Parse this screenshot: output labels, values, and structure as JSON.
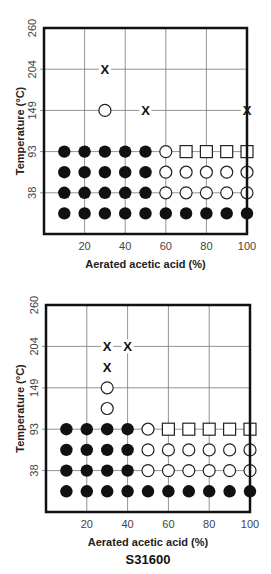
{
  "chart_data": [
    {
      "type": "scatter",
      "title": "S30400",
      "xlabel": "Aerated acetic acid (%)",
      "ylabel": "Temperature (°C)",
      "x_ticks": [
        20,
        40,
        60,
        80,
        100
      ],
      "y_ticks": [
        38,
        93,
        149,
        204,
        260
      ],
      "xlim": [
        0,
        100
      ],
      "grid": true,
      "legend": "none",
      "markers": {
        "filled_circle": "row of filled black circles",
        "open_circle": "open circle",
        "open_square": "open square",
        "x": "cross mark"
      },
      "rows": [
        {
          "y": "204",
          "points": [
            {
              "x": 30,
              "marker": "x"
            }
          ]
        },
        {
          "y": "149",
          "points": [
            {
              "x": 30,
              "marker": "open_circle"
            },
            {
              "x": 50,
              "marker": "x"
            },
            {
              "x": 100,
              "marker": "x"
            }
          ]
        },
        {
          "y": "93",
          "points": [
            {
              "x": 10,
              "marker": "filled_circle"
            },
            {
              "x": 20,
              "marker": "filled_circle"
            },
            {
              "x": 30,
              "marker": "filled_circle"
            },
            {
              "x": 40,
              "marker": "filled_circle"
            },
            {
              "x": 50,
              "marker": "filled_circle"
            },
            {
              "x": 60,
              "marker": "open_circle"
            },
            {
              "x": 70,
              "marker": "open_square"
            },
            {
              "x": 80,
              "marker": "open_square"
            },
            {
              "x": 90,
              "marker": "open_square"
            },
            {
              "x": 100,
              "marker": "open_square"
            }
          ]
        },
        {
          "y": "between 38 and 93",
          "points": [
            {
              "x": 10,
              "marker": "filled_circle"
            },
            {
              "x": 20,
              "marker": "filled_circle"
            },
            {
              "x": 30,
              "marker": "filled_circle"
            },
            {
              "x": 40,
              "marker": "filled_circle"
            },
            {
              "x": 50,
              "marker": "filled_circle"
            },
            {
              "x": 60,
              "marker": "open_circle"
            },
            {
              "x": 70,
              "marker": "open_circle"
            },
            {
              "x": 80,
              "marker": "open_circle"
            },
            {
              "x": 90,
              "marker": "open_circle"
            },
            {
              "x": 100,
              "marker": "open_circle"
            }
          ]
        },
        {
          "y": "38",
          "points": [
            {
              "x": 10,
              "marker": "filled_circle"
            },
            {
              "x": 20,
              "marker": "filled_circle"
            },
            {
              "x": 30,
              "marker": "filled_circle"
            },
            {
              "x": 40,
              "marker": "filled_circle"
            },
            {
              "x": 50,
              "marker": "filled_circle"
            },
            {
              "x": 60,
              "marker": "open_circle"
            },
            {
              "x": 70,
              "marker": "open_circle"
            },
            {
              "x": 80,
              "marker": "open_circle"
            },
            {
              "x": 90,
              "marker": "open_circle"
            },
            {
              "x": 100,
              "marker": "open_circle"
            }
          ]
        },
        {
          "y": "below 38",
          "points": [
            {
              "x": 10,
              "marker": "filled_circle"
            },
            {
              "x": 20,
              "marker": "filled_circle"
            },
            {
              "x": 30,
              "marker": "filled_circle"
            },
            {
              "x": 40,
              "marker": "filled_circle"
            },
            {
              "x": 50,
              "marker": "filled_circle"
            },
            {
              "x": 60,
              "marker": "filled_circle"
            },
            {
              "x": 70,
              "marker": "filled_circle"
            },
            {
              "x": 80,
              "marker": "filled_circle"
            },
            {
              "x": 90,
              "marker": "filled_circle"
            },
            {
              "x": 100,
              "marker": "filled_circle"
            }
          ]
        }
      ]
    },
    {
      "type": "scatter",
      "title": "S31600",
      "xlabel": "Aerated acetic acid (%)",
      "ylabel": "Temperature (°C)",
      "x_ticks": [
        20,
        40,
        60,
        80,
        100
      ],
      "y_ticks": [
        38,
        93,
        149,
        204,
        260
      ],
      "xlim": [
        0,
        100
      ],
      "grid": true,
      "legend": "none",
      "rows": [
        {
          "y": "204",
          "points": [
            {
              "x": 30,
              "marker": "x"
            },
            {
              "x": 40,
              "marker": "x"
            }
          ]
        },
        {
          "y": "between 149 and 204",
          "points": [
            {
              "x": 30,
              "marker": "x"
            }
          ]
        },
        {
          "y": "149",
          "points": [
            {
              "x": 30,
              "marker": "open_circle"
            }
          ]
        },
        {
          "y": "between 93 and 149",
          "points": [
            {
              "x": 30,
              "marker": "open_circle"
            }
          ]
        },
        {
          "y": "93",
          "points": [
            {
              "x": 10,
              "marker": "filled_circle"
            },
            {
              "x": 20,
              "marker": "filled_circle"
            },
            {
              "x": 30,
              "marker": "filled_circle"
            },
            {
              "x": 40,
              "marker": "filled_circle"
            },
            {
              "x": 50,
              "marker": "open_circle"
            },
            {
              "x": 60,
              "marker": "open_square"
            },
            {
              "x": 70,
              "marker": "open_square"
            },
            {
              "x": 80,
              "marker": "open_square"
            },
            {
              "x": 90,
              "marker": "open_square"
            },
            {
              "x": 100,
              "marker": "open_square"
            }
          ]
        },
        {
          "y": "between 38 and 93",
          "points": [
            {
              "x": 10,
              "marker": "filled_circle"
            },
            {
              "x": 20,
              "marker": "filled_circle"
            },
            {
              "x": 30,
              "marker": "filled_circle"
            },
            {
              "x": 40,
              "marker": "filled_circle"
            },
            {
              "x": 50,
              "marker": "open_circle"
            },
            {
              "x": 60,
              "marker": "open_circle"
            },
            {
              "x": 70,
              "marker": "open_circle"
            },
            {
              "x": 80,
              "marker": "open_circle"
            },
            {
              "x": 90,
              "marker": "open_circle"
            },
            {
              "x": 100,
              "marker": "open_circle"
            }
          ]
        },
        {
          "y": "38",
          "points": [
            {
              "x": 10,
              "marker": "filled_circle"
            },
            {
              "x": 20,
              "marker": "filled_circle"
            },
            {
              "x": 30,
              "marker": "filled_circle"
            },
            {
              "x": 40,
              "marker": "filled_circle"
            },
            {
              "x": 50,
              "marker": "open_circle"
            },
            {
              "x": 60,
              "marker": "open_circle"
            },
            {
              "x": 70,
              "marker": "open_circle"
            },
            {
              "x": 80,
              "marker": "open_circle"
            },
            {
              "x": 90,
              "marker": "open_circle"
            },
            {
              "x": 100,
              "marker": "open_circle"
            }
          ]
        },
        {
          "y": "below 38",
          "points": [
            {
              "x": 10,
              "marker": "filled_circle"
            },
            {
              "x": 20,
              "marker": "filled_circle"
            },
            {
              "x": 30,
              "marker": "filled_circle"
            },
            {
              "x": 40,
              "marker": "filled_circle"
            },
            {
              "x": 50,
              "marker": "filled_circle"
            },
            {
              "x": 60,
              "marker": "filled_circle"
            },
            {
              "x": 70,
              "marker": "filled_circle"
            },
            {
              "x": 80,
              "marker": "filled_circle"
            },
            {
              "x": 90,
              "marker": "filled_circle"
            },
            {
              "x": 100,
              "marker": "filled_circle"
            }
          ]
        }
      ]
    }
  ],
  "render": [
    {
      "title": "S30400",
      "top": 0,
      "frame": {
        "x0": 44,
        "y0": 28,
        "x1": 247,
        "y1": 234
      },
      "ytick_rows": {
        "260": 0,
        "204": 2,
        "149": 4,
        "93": 6,
        "38": 8
      },
      "points": [
        {
          "x": 30,
          "r": 2,
          "m": "x"
        },
        {
          "x": 30,
          "r": 4,
          "m": "o"
        },
        {
          "x": 50,
          "r": 4,
          "m": "x"
        },
        {
          "x": 100,
          "r": 4,
          "m": "x"
        },
        {
          "x": 10,
          "r": 6,
          "m": "f"
        },
        {
          "x": 20,
          "r": 6,
          "m": "f"
        },
        {
          "x": 30,
          "r": 6,
          "m": "f"
        },
        {
          "x": 40,
          "r": 6,
          "m": "f"
        },
        {
          "x": 50,
          "r": 6,
          "m": "f"
        },
        {
          "x": 60,
          "r": 6,
          "m": "o"
        },
        {
          "x": 70,
          "r": 6,
          "m": "s"
        },
        {
          "x": 80,
          "r": 6,
          "m": "s"
        },
        {
          "x": 90,
          "r": 6,
          "m": "s"
        },
        {
          "x": 100,
          "r": 6,
          "m": "s"
        },
        {
          "x": 10,
          "r": 7,
          "m": "f"
        },
        {
          "x": 20,
          "r": 7,
          "m": "f"
        },
        {
          "x": 30,
          "r": 7,
          "m": "f"
        },
        {
          "x": 40,
          "r": 7,
          "m": "f"
        },
        {
          "x": 50,
          "r": 7,
          "m": "f"
        },
        {
          "x": 60,
          "r": 7,
          "m": "o"
        },
        {
          "x": 70,
          "r": 7,
          "m": "o"
        },
        {
          "x": 80,
          "r": 7,
          "m": "o"
        },
        {
          "x": 90,
          "r": 7,
          "m": "o"
        },
        {
          "x": 100,
          "r": 7,
          "m": "o"
        },
        {
          "x": 10,
          "r": 8,
          "m": "f"
        },
        {
          "x": 20,
          "r": 8,
          "m": "f"
        },
        {
          "x": 30,
          "r": 8,
          "m": "f"
        },
        {
          "x": 40,
          "r": 8,
          "m": "f"
        },
        {
          "x": 50,
          "r": 8,
          "m": "f"
        },
        {
          "x": 60,
          "r": 8,
          "m": "o"
        },
        {
          "x": 70,
          "r": 8,
          "m": "o"
        },
        {
          "x": 80,
          "r": 8,
          "m": "o"
        },
        {
          "x": 90,
          "r": 8,
          "m": "o"
        },
        {
          "x": 100,
          "r": 8,
          "m": "o"
        },
        {
          "x": 10,
          "r": 9,
          "m": "f"
        },
        {
          "x": 20,
          "r": 9,
          "m": "f"
        },
        {
          "x": 30,
          "r": 9,
          "m": "f"
        },
        {
          "x": 40,
          "r": 9,
          "m": "f"
        },
        {
          "x": 50,
          "r": 9,
          "m": "f"
        },
        {
          "x": 60,
          "r": 9,
          "m": "f"
        },
        {
          "x": 70,
          "r": 9,
          "m": "f"
        },
        {
          "x": 80,
          "r": 9,
          "m": "f"
        },
        {
          "x": 90,
          "r": 9,
          "m": "f"
        },
        {
          "x": 100,
          "r": 9,
          "m": "f"
        }
      ]
    },
    {
      "title": "S31600",
      "top": 277,
      "frame": {
        "x0": 46,
        "y0": 28,
        "x1": 250,
        "y1": 235
      },
      "ytick_rows": {
        "260": 0,
        "204": 2,
        "149": 4,
        "93": 6,
        "38": 8
      },
      "points": [
        {
          "x": 30,
          "r": 2,
          "m": "x"
        },
        {
          "x": 40,
          "r": 2,
          "m": "x"
        },
        {
          "x": 30,
          "r": 3,
          "m": "x"
        },
        {
          "x": 30,
          "r": 4,
          "m": "o"
        },
        {
          "x": 30,
          "r": 5,
          "m": "o"
        },
        {
          "x": 10,
          "r": 6,
          "m": "f"
        },
        {
          "x": 20,
          "r": 6,
          "m": "f"
        },
        {
          "x": 30,
          "r": 6,
          "m": "f"
        },
        {
          "x": 40,
          "r": 6,
          "m": "f"
        },
        {
          "x": 50,
          "r": 6,
          "m": "o"
        },
        {
          "x": 60,
          "r": 6,
          "m": "s"
        },
        {
          "x": 70,
          "r": 6,
          "m": "s"
        },
        {
          "x": 80,
          "r": 6,
          "m": "s"
        },
        {
          "x": 90,
          "r": 6,
          "m": "s"
        },
        {
          "x": 100,
          "r": 6,
          "m": "s"
        },
        {
          "x": 10,
          "r": 7,
          "m": "f"
        },
        {
          "x": 20,
          "r": 7,
          "m": "f"
        },
        {
          "x": 30,
          "r": 7,
          "m": "f"
        },
        {
          "x": 40,
          "r": 7,
          "m": "f"
        },
        {
          "x": 50,
          "r": 7,
          "m": "o"
        },
        {
          "x": 60,
          "r": 7,
          "m": "o"
        },
        {
          "x": 70,
          "r": 7,
          "m": "o"
        },
        {
          "x": 80,
          "r": 7,
          "m": "o"
        },
        {
          "x": 90,
          "r": 7,
          "m": "o"
        },
        {
          "x": 100,
          "r": 7,
          "m": "o"
        },
        {
          "x": 10,
          "r": 8,
          "m": "f"
        },
        {
          "x": 20,
          "r": 8,
          "m": "f"
        },
        {
          "x": 30,
          "r": 8,
          "m": "f"
        },
        {
          "x": 40,
          "r": 8,
          "m": "f"
        },
        {
          "x": 50,
          "r": 8,
          "m": "o"
        },
        {
          "x": 60,
          "r": 8,
          "m": "o"
        },
        {
          "x": 70,
          "r": 8,
          "m": "o"
        },
        {
          "x": 80,
          "r": 8,
          "m": "o"
        },
        {
          "x": 90,
          "r": 8,
          "m": "o"
        },
        {
          "x": 100,
          "r": 8,
          "m": "o"
        },
        {
          "x": 10,
          "r": 9,
          "m": "f"
        },
        {
          "x": 20,
          "r": 9,
          "m": "f"
        },
        {
          "x": 30,
          "r": 9,
          "m": "f"
        },
        {
          "x": 40,
          "r": 9,
          "m": "f"
        },
        {
          "x": 50,
          "r": 9,
          "m": "f"
        },
        {
          "x": 60,
          "r": 9,
          "m": "f"
        },
        {
          "x": 70,
          "r": 9,
          "m": "f"
        },
        {
          "x": 80,
          "r": 9,
          "m": "f"
        },
        {
          "x": 90,
          "r": 9,
          "m": "f"
        },
        {
          "x": 100,
          "r": 9,
          "m": "f"
        }
      ]
    }
  ],
  "labels": {
    "xlabel": "Aerated acetic acid (%)",
    "ylabel": "Temperature (°C)",
    "top_title": "S30400",
    "bottom_title": "S31600"
  }
}
